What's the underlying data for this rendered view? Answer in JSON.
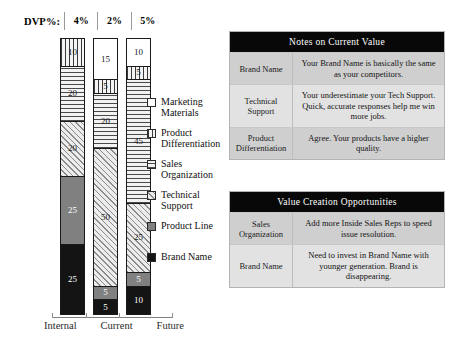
{
  "chart_data": {
    "type": "bar",
    "title": "",
    "xlabel": "",
    "ylabel": "",
    "stacked": true,
    "ylim": [
      0,
      100
    ],
    "grid": false,
    "legend_position": "right",
    "categories": [
      "Internal",
      "Current",
      "Future"
    ],
    "series": [
      {
        "name": "Marketing Materials",
        "values": [
          0,
          15,
          10
        ]
      },
      {
        "name": "Product Differentiation",
        "values": [
          10,
          5,
          5
        ]
      },
      {
        "name": "Sales Organization",
        "values": [
          20,
          20,
          45
        ]
      },
      {
        "name": "Technical Support",
        "values": [
          20,
          50,
          25
        ]
      },
      {
        "name": "Product Line",
        "values": [
          25,
          5,
          5
        ]
      },
      {
        "name": "Brand Name",
        "values": [
          25,
          5,
          10
        ]
      }
    ],
    "annotations": {
      "dvp_label": "DVP%:",
      "dvp_values": [
        "4%",
        "2%",
        "5%"
      ]
    }
  },
  "header": {
    "dvp_label": "DVP%:",
    "dvp_values": [
      "4%",
      "2%",
      "5%"
    ]
  },
  "bars": [
    {
      "category": "Internal",
      "segments": [
        {
          "label": "Product Differentiation",
          "value": "10",
          "pattern": "vert",
          "pct": 10
        },
        {
          "label": "Sales Organization",
          "value": "20",
          "pattern": "horiz",
          "pct": 20
        },
        {
          "label": "Technical Support",
          "value": "20",
          "pattern": "diag",
          "pct": 20
        },
        {
          "label": "Product Line",
          "value": "25",
          "pattern": "gray",
          "pct": 25
        },
        {
          "label": "Brand Name",
          "value": "25",
          "pattern": "black",
          "pct": 25
        }
      ]
    },
    {
      "category": "Current",
      "segments": [
        {
          "label": "Marketing Materials",
          "value": "15",
          "pattern": "white",
          "pct": 15
        },
        {
          "label": "Product Differentiation",
          "value": "5",
          "pattern": "vert",
          "pct": 5
        },
        {
          "label": "Sales Organization",
          "value": "20",
          "pattern": "horiz",
          "pct": 20
        },
        {
          "label": "Technical Support",
          "value": "50",
          "pattern": "diag",
          "pct": 50
        },
        {
          "label": "Product Line",
          "value": "5",
          "pattern": "gray",
          "pct": 5
        },
        {
          "label": "Brand Name",
          "value": "5",
          "pattern": "black",
          "pct": 5
        }
      ]
    },
    {
      "category": "Future",
      "segments": [
        {
          "label": "Marketing Materials",
          "value": "10",
          "pattern": "white",
          "pct": 10
        },
        {
          "label": "Product Differentiation",
          "value": "5",
          "pattern": "vert",
          "pct": 5
        },
        {
          "label": "Sales Organization",
          "value": "45",
          "pattern": "horiz",
          "pct": 45
        },
        {
          "label": "Technical Support",
          "value": "25",
          "pattern": "diag",
          "pct": 25
        },
        {
          "label": "Product Line",
          "value": "5",
          "pattern": "gray",
          "pct": 5
        },
        {
          "label": "Brand Name",
          "value": "10",
          "pattern": "black",
          "pct": 10
        }
      ]
    }
  ],
  "axis": {
    "labels": [
      "Internal",
      "Current",
      "Future"
    ]
  },
  "legend": {
    "items": [
      {
        "label": "Marketing Materials",
        "pattern": "white"
      },
      {
        "label": "Product Differentiation",
        "pattern": "vert"
      },
      {
        "label": "Sales Organization",
        "pattern": "horiz"
      },
      {
        "label": "Technical Support",
        "pattern": "diag"
      },
      {
        "label": "Product Line",
        "pattern": "gray"
      },
      {
        "label": "Brand Name",
        "pattern": "black"
      }
    ]
  },
  "tables": {
    "notes": {
      "title": "Notes on Current Value",
      "rows": [
        {
          "category": "Brand Name",
          "note": "Your Brand Name is basically the same as your competitors."
        },
        {
          "category": "Technical Support",
          "note": "Your underestimate your Tech Support. Quick, accurate responses help me win more jobs."
        },
        {
          "category": "Product Differentiation",
          "note": "Agree. Your products have a higher quality."
        }
      ]
    },
    "opportunities": {
      "title": "Value Creation Opportunities",
      "rows": [
        {
          "category": "Sales Organization",
          "note": "Add more Inside Sales Reps to speed issue resolution."
        },
        {
          "category": "Brand Name",
          "note": "Need to invest in Brand Name with younger generation. Brand is disappearing."
        }
      ]
    }
  },
  "colors": {
    "header_bar": "#080808",
    "row_shade_dark": "#cfcfcf",
    "row_shade_light": "#e2e2e2",
    "product_line": "#808080",
    "brand_name": "#141414"
  }
}
